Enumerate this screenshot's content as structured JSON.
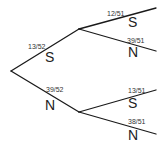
{
  "diagram": {
    "type": "probability-tree",
    "line_color": "#1a1a1a",
    "level1": [
      {
        "outcome": "S",
        "probability": "13/52"
      },
      {
        "outcome": "N",
        "probability": "39/52"
      }
    ],
    "level2_after_S": [
      {
        "outcome": "S",
        "probability": "12/51"
      },
      {
        "outcome": "N",
        "probability": "39/51"
      }
    ],
    "level2_after_N": [
      {
        "outcome": "S",
        "probability": "13/51"
      },
      {
        "outcome": "N",
        "probability": "38/51"
      }
    ]
  }
}
